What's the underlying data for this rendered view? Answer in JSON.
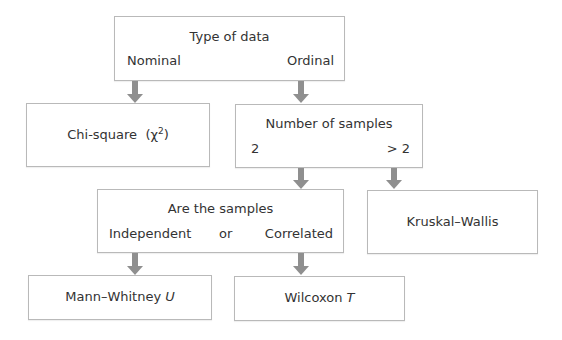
{
  "diagram": {
    "type_of_data": {
      "title": "Type of data",
      "left_option": "Nominal",
      "right_option": "Ordinal"
    },
    "chi_square": {
      "label": "Chi-square",
      "symbol_open": "(χ",
      "superscript": "2",
      "symbol_close": ")"
    },
    "number_of_samples": {
      "title": "Number of samples",
      "left_option": "2",
      "right_option": "> 2"
    },
    "kruskal_wallis": {
      "label": "Kruskal–Wallis"
    },
    "are_samples": {
      "title": "Are the samples",
      "left_option": "Independent",
      "middle": "or",
      "right_option": "Correlated"
    },
    "mann_whitney": {
      "label": "Mann–Whitney",
      "variable": "U"
    },
    "wilcoxon": {
      "label": "Wilcoxon",
      "variable": "T"
    },
    "colors": {
      "box_border": "#b9b9b9",
      "arrow": "#8f8f8f",
      "text": "#333333"
    }
  }
}
